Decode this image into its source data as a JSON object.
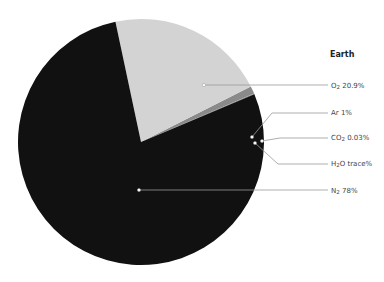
{
  "chart_data": {
    "type": "pie",
    "title": "Earth",
    "categories": [
      "O2",
      "Ar",
      "CO2",
      "H2O",
      "N2"
    ],
    "values": [
      20.9,
      1,
      0.03,
      0.07,
      78
    ],
    "labels": [
      "O2 20.9%",
      "Ar 1%",
      "CO2 0.03%",
      "H2O trace%",
      "N2 78%"
    ],
    "colors": [
      "#d3d3d3",
      "#8a8a8a",
      "#bdbdbd",
      "#555555",
      "#111111"
    ],
    "legend_position": "right-callouts",
    "start_angle_deg": 0,
    "direction": "counterclockwise-from-east"
  },
  "labels": {
    "o2": {
      "base": "O",
      "sub": "2",
      "rest": " 20.9%"
    },
    "ar": {
      "base": "Ar 1%",
      "sub": "",
      "rest": ""
    },
    "co2": {
      "base": "CO",
      "sub": "2",
      "rest": " 0.03%"
    },
    "h2o": {
      "base": "H",
      "sub": "2",
      "rest": "O trace%"
    },
    "n2": {
      "base": "N",
      "sub": "2",
      "rest": " 78%"
    }
  }
}
